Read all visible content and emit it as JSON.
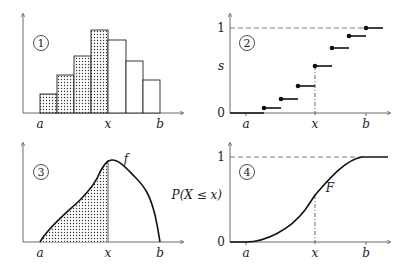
{
  "panels": [
    {
      "id": 1,
      "badge": "1",
      "type": "histogram",
      "x_labels": {
        "a": "a",
        "x": "x",
        "b": "b"
      },
      "bars_heights_px": [
        19,
        38,
        57,
        83,
        73,
        52,
        33
      ],
      "shaded_bars": 4
    },
    {
      "id": 2,
      "badge": "2",
      "type": "step_cdf",
      "x_labels": {
        "a": "a",
        "x": "x",
        "b": "b"
      },
      "y_labels": {
        "zero": "0",
        "s": "s",
        "one": "1"
      }
    },
    {
      "id": 3,
      "badge": "3",
      "type": "density",
      "x_labels": {
        "a": "a",
        "x": "x",
        "b": "b"
      },
      "curve_label": "f"
    },
    {
      "id": 4,
      "badge": "4",
      "type": "cdf",
      "x_labels": {
        "a": "a",
        "x": "x",
        "b": "b"
      },
      "y_labels": {
        "zero": "0",
        "px": "P(X ≤ x)",
        "one": "1"
      },
      "curve_label": "F"
    }
  ]
}
